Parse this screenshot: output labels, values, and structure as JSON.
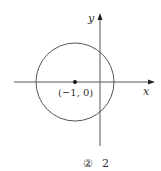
{
  "diagram": {
    "axes": {
      "x_label": "x",
      "y_label": "y"
    },
    "circle": {
      "center_label": "(−1, 0)",
      "center": [
        -1,
        0
      ]
    },
    "choice": {
      "marker": "②",
      "value": "2"
    },
    "colors": {
      "stroke": "#555555",
      "text": "#333333"
    }
  }
}
